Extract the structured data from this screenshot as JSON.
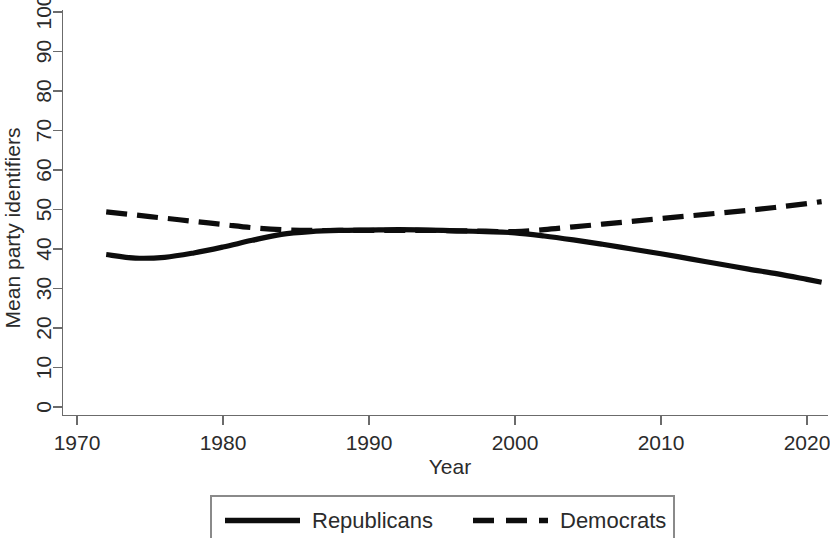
{
  "chart_data": {
    "type": "line",
    "title": "",
    "xlabel": "Year",
    "ylabel": "Mean party identifiers",
    "xlim": [
      1970,
      2022
    ],
    "ylim": [
      0,
      100
    ],
    "xticks": [
      1970,
      1980,
      1990,
      2000,
      2010,
      2020
    ],
    "xtick_labels": [
      "1970",
      "1980",
      "1990",
      "2000",
      "2010",
      "2020"
    ],
    "yticks": [
      0,
      10,
      20,
      30,
      40,
      50,
      60,
      70,
      80,
      90,
      100
    ],
    "ytick_labels": [
      "0",
      "10",
      "20",
      "30",
      "40",
      "50",
      "60",
      "70",
      "80",
      "90",
      "100"
    ],
    "grid": false,
    "legend_position": "bottom-center",
    "series": [
      {
        "name": "Republicans",
        "style": "solid",
        "color": "#0d0d0d",
        "x": [
          1972,
          1974,
          1976,
          1978,
          1980,
          1982,
          1984,
          1986,
          1988,
          1990,
          1992,
          1994,
          1996,
          1998,
          2000,
          2002,
          2004,
          2006,
          2008,
          2010,
          2012,
          2014,
          2016,
          2018,
          2020,
          2021
        ],
        "values": [
          38.6,
          37.7,
          37.9,
          39.0,
          40.5,
          42.2,
          43.7,
          44.4,
          44.7,
          44.8,
          44.9,
          44.8,
          44.6,
          44.4,
          44.1,
          43.3,
          42.3,
          41.2,
          40.0,
          38.8,
          37.5,
          36.2,
          34.9,
          33.7,
          32.3,
          31.6
        ]
      },
      {
        "name": "Democrats",
        "style": "dashed",
        "color": "#0d0d0d",
        "x": [
          1972,
          1974,
          1976,
          1978,
          1980,
          1982,
          1984,
          1986,
          1988,
          1990,
          1992,
          1994,
          1996,
          1998,
          2000,
          2002,
          2004,
          2006,
          2008,
          2010,
          2012,
          2014,
          2016,
          2018,
          2020,
          2021
        ],
        "values": [
          49.4,
          48.6,
          47.8,
          47.0,
          46.2,
          45.4,
          44.9,
          44.7,
          44.7,
          44.7,
          44.7,
          44.7,
          44.6,
          44.5,
          44.4,
          44.9,
          45.6,
          46.3,
          47.0,
          47.7,
          48.4,
          49.1,
          49.8,
          50.6,
          51.5,
          52.0
        ]
      }
    ],
    "legend": [
      {
        "label": "Republicans",
        "style": "solid"
      },
      {
        "label": "Democrats",
        "style": "dashed"
      }
    ]
  },
  "legend_panel": {
    "republicans_label": "Republicans",
    "democrats_label": "Democrats"
  },
  "axes": {
    "x_title": "Year",
    "y_title": "Mean party identifiers"
  }
}
